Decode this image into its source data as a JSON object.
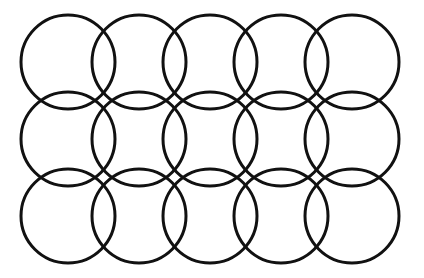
{
  "diagram": {
    "type": "overlapping-circle-grid",
    "width": 424,
    "height": 278,
    "background": "#ffffff",
    "stroke_color": "#111111",
    "stroke_width": 3,
    "radius": 47,
    "columns_x": [
      68,
      139,
      210,
      281,
      352
    ],
    "rows_y": [
      62,
      139,
      216
    ],
    "circle_count": 15
  }
}
